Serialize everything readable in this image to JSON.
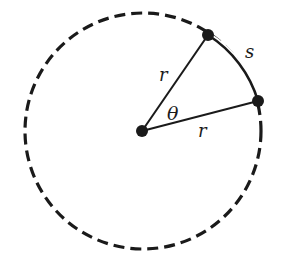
{
  "diagram": {
    "colors": {
      "stroke": "#1a1a1a",
      "background": "#ffffff"
    },
    "circle": {
      "cx": 143,
      "cy": 131,
      "r": 118,
      "style": "dashed"
    },
    "points": {
      "center": {
        "x": 142,
        "y": 131
      },
      "A": {
        "x": 208,
        "y": 35
      },
      "B": {
        "x": 258,
        "y": 101
      }
    },
    "labels": {
      "radius_upper": "r",
      "radius_lower": "r",
      "angle": "θ",
      "arc": "s"
    }
  }
}
